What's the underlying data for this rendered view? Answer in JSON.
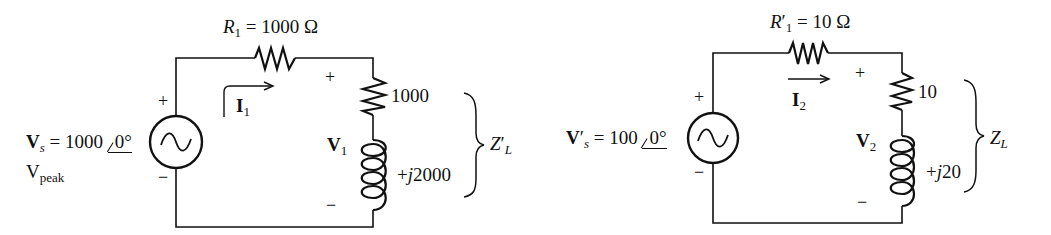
{
  "circuit_left": {
    "resistor_label": {
      "sym": "R",
      "sub": "1",
      "value": " = 1000 Ω"
    },
    "source_label": {
      "sym": "V",
      "sub": "s",
      "value": " = 1000 ",
      "angle": "0°"
    },
    "source_unit": {
      "main": "V",
      "sub": "peak"
    },
    "current_label": {
      "sym": "I",
      "sub": "1"
    },
    "voltage_label": {
      "sym": "V",
      "sub": "1"
    },
    "load_resistance": "1000",
    "load_reactance": "+j2000",
    "load_reactance_parts": {
      "prefix": "+",
      "j": "j",
      "num": "2000"
    },
    "impedance_label": {
      "sym": "Z",
      "prime": "′",
      "sub": "L"
    },
    "plus": "+",
    "minus": "−"
  },
  "circuit_right": {
    "resistor_label": {
      "sym": "R",
      "prime": "′",
      "sub": "1",
      "value": " = 10 Ω"
    },
    "source_label": {
      "sym": "V",
      "prime": "′",
      "sub": "s",
      "value": " = 100 ",
      "angle": "0°"
    },
    "current_label": {
      "sym": "I",
      "sub": "2"
    },
    "voltage_label": {
      "sym": "V",
      "sub": "2"
    },
    "load_resistance": "10",
    "load_reactance": "+j20",
    "load_reactance_parts": {
      "prefix": "+",
      "j": "j",
      "num": "20"
    },
    "impedance_label": {
      "sym": "Z",
      "sub": "L"
    },
    "plus": "+",
    "minus": "−"
  },
  "colors": {
    "ink": "#111111",
    "background": "#ffffff"
  }
}
